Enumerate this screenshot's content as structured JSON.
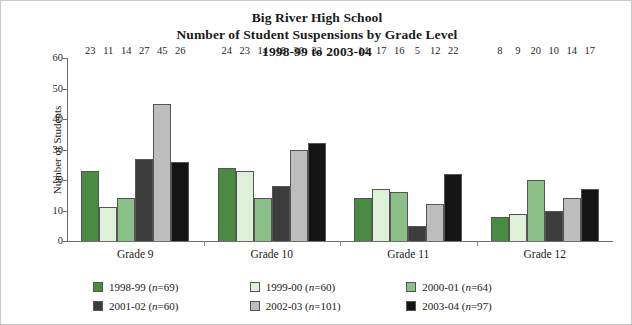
{
  "title": {
    "line1": "Big River High School",
    "line2": "Number of Student Suspensions by Grade Level",
    "line3": "1998-99 to 2003-04"
  },
  "axes": {
    "ylabel": "Number of Students",
    "yticks": [
      "0",
      "10",
      "20",
      "30",
      "40",
      "50",
      "60"
    ],
    "xlabel": ""
  },
  "legend": {
    "items": [
      {
        "label": "1998-99 (n=69)",
        "year": "1998-99",
        "n": "69",
        "color": "#4a8a42"
      },
      {
        "label": "1999-00 (n=60)",
        "year": "1999-00",
        "n": "60",
        "color": "#dff0d8"
      },
      {
        "label": "2000-01 (n=64)",
        "year": "2000-01",
        "n": "64",
        "color": "#8cc089"
      },
      {
        "label": "2001-02 (n=60)",
        "year": "2001-02",
        "n": "60",
        "color": "#3d3d3d"
      },
      {
        "label": "2002-03 (n=101)",
        "year": "2002-03",
        "n": "101",
        "color": "#bdbdbd"
      },
      {
        "label": "2003-04 (n=97)",
        "year": "2003-04",
        "n": "97",
        "color": "#141414"
      }
    ]
  },
  "chart_data": {
    "type": "bar",
    "xlabel": "",
    "ylabel": "Number of Students",
    "ylim": [
      0,
      60
    ],
    "ytick_step": 10,
    "grid": false,
    "legend_position": "bottom",
    "categories": [
      "Grade 9",
      "Grade 10",
      "Grade 11",
      "Grade 12"
    ],
    "series": [
      {
        "name": "1998-99 (n=69)",
        "color": "#4a8a42",
        "values": [
          23,
          24,
          14,
          8
        ]
      },
      {
        "name": "1999-00 (n=60)",
        "color": "#dff0d8",
        "values": [
          11,
          23,
          17,
          9
        ]
      },
      {
        "name": "2000-01 (n=64)",
        "color": "#8cc089",
        "values": [
          14,
          14,
          16,
          20
        ]
      },
      {
        "name": "2001-02 (n=60)",
        "color": "#3d3d3d",
        "values": [
          27,
          18,
          5,
          10
        ]
      },
      {
        "name": "2002-03 (n=101)",
        "color": "#bdbdbd",
        "values": [
          45,
          30,
          12,
          14
        ]
      },
      {
        "name": "2003-04 (n=97)",
        "color": "#141414",
        "values": [
          26,
          32,
          22,
          17
        ]
      }
    ]
  }
}
